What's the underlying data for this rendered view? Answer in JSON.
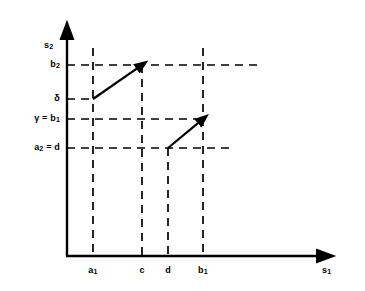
{
  "figure": {
    "kind": "mathematical-diagram",
    "background_color": "#ffffff",
    "ink_color": "#000000",
    "axes": {
      "x_axis_label": "s₁",
      "y_axis_label": "s₂",
      "x_axis_label_name": "s1",
      "y_axis_label_name": "s2",
      "origin_px": [
        67,
        256
      ],
      "x_axis_end_px": [
        330,
        256
      ],
      "y_axis_top_px": [
        67,
        27
      ],
      "arrowheads": [
        "x-axis-right",
        "y-axis-top"
      ]
    },
    "y_ticks": [
      {
        "id": "b2",
        "label_html": "b<sub>2</sub>",
        "label_text": "b₂",
        "y_px": 65
      },
      {
        "id": "delta",
        "label_html": "&#948;",
        "label_text": "δ",
        "y_px": 99
      },
      {
        "id": "gamma_b1",
        "label_html": "&#947; = b<sub>1</sub>",
        "label_text": "γ = b₁",
        "y_px": 119
      },
      {
        "id": "a2_d",
        "label_html": "a<sub>2</sub> = d",
        "label_text": "a₂ = d",
        "y_px": 148
      }
    ],
    "x_ticks": [
      {
        "id": "a1",
        "label_html": "a<sub>1</sub>",
        "label_text": "a₁",
        "x_px": 93
      },
      {
        "id": "c",
        "label_html": "c",
        "label_text": "c",
        "x_px": 142
      },
      {
        "id": "d",
        "label_html": "d",
        "label_text": "d",
        "x_px": 168
      },
      {
        "id": "b1",
        "label_html": "b<sub>1</sub>",
        "label_text": "b₁",
        "x_px": 203
      }
    ],
    "dashed_horizontals": [
      {
        "id": "h-b2",
        "y_px": 65,
        "x_start_px": 67,
        "x_end_px": 258,
        "tick": "b2"
      },
      {
        "id": "h-delta",
        "y_px": 99,
        "x_start_px": 67,
        "x_end_px": 95,
        "tick": "delta"
      },
      {
        "id": "h-gamma-b1",
        "y_px": 119,
        "x_start_px": 67,
        "x_end_px": 205,
        "tick": "gamma_b1"
      },
      {
        "id": "h-a2-d",
        "y_px": 148,
        "x_start_px": 67,
        "x_end_px": 232,
        "tick": "a2_d"
      }
    ],
    "dashed_verticals": [
      {
        "id": "v-a1",
        "x_px": 93,
        "y_top_px": 48,
        "y_bottom_px": 256,
        "tick": "a1"
      },
      {
        "id": "v-c",
        "x_px": 142,
        "y_top_px": 65,
        "y_bottom_px": 256,
        "tick": "c"
      },
      {
        "id": "v-d",
        "x_px": 168,
        "y_top_px": 148,
        "y_bottom_px": 256,
        "tick": "d"
      },
      {
        "id": "v-b1",
        "x_px": 203,
        "y_top_px": 48,
        "y_bottom_px": 256,
        "tick": "b1"
      }
    ],
    "arrows": [
      {
        "id": "arrow-1",
        "from_label": "(a₁, δ)",
        "to_label": "(c, b₂)",
        "from_px": [
          93,
          99
        ],
        "to_px": [
          142,
          65
        ]
      },
      {
        "id": "arrow-2",
        "from_label": "(d, a₂ = d)",
        "to_label": "(b₁, γ = b₁)",
        "from_px": [
          168,
          148
        ],
        "to_px": [
          203,
          119
        ]
      }
    ]
  }
}
